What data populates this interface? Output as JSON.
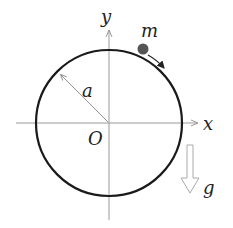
{
  "diagram": {
    "labels": {
      "y_axis": "y",
      "x_axis": "x",
      "mass": "m",
      "radius": "a",
      "origin": "O",
      "gravity": "g"
    },
    "colors": {
      "circle": "#1a1a1a",
      "axes": "#999999",
      "mass": "#555555",
      "gravity_arrow": "#aaaaaa"
    }
  }
}
